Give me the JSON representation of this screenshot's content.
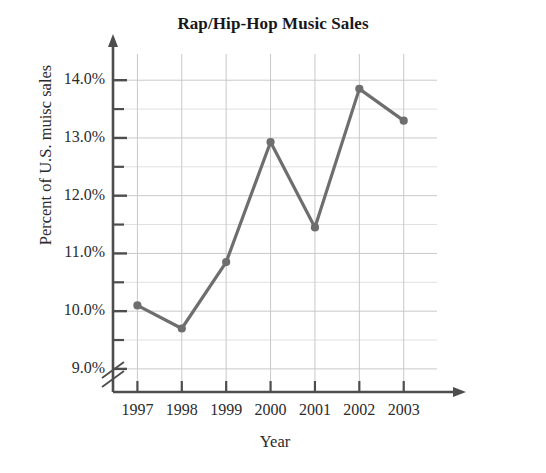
{
  "chart_data": {
    "type": "line",
    "title": "Rap/Hip-Hop Music Sales",
    "xlabel": "Year",
    "ylabel": "Percent of U.S. muisc sales",
    "categories": [
      "1997",
      "1998",
      "1999",
      "2000",
      "2001",
      "2002",
      "2003"
    ],
    "x": [
      1997,
      1998,
      1999,
      2000,
      2001,
      2002,
      2003
    ],
    "values": [
      10.1,
      9.7,
      10.85,
      12.93,
      11.45,
      13.85,
      13.3
    ],
    "series": [
      {
        "name": "Percent of U.S. music sales",
        "values": [
          10.1,
          9.7,
          10.85,
          12.93,
          11.45,
          13.85,
          13.3
        ]
      }
    ],
    "ytick_labels": [
      "9.0%",
      "10.0%",
      "11.0%",
      "12.0%",
      "13.0%",
      "14.0%"
    ],
    "ytick_values": [
      9.0,
      10.0,
      11.0,
      12.0,
      13.0,
      14.0
    ],
    "yminor_values": [
      9.5,
      10.5,
      11.5,
      12.5,
      13.5
    ],
    "ylim": [
      8.6,
      14.35
    ],
    "xlim": [
      1996.45,
      2003.75
    ],
    "grid": true,
    "axis_break": true,
    "legend": "none",
    "series_color": "#6e6e6e",
    "grid_color": "#c9c9c9",
    "axis_color": "#4d4d4d",
    "marker": "circle",
    "marker_size": 7,
    "line_width": 3.2
  }
}
